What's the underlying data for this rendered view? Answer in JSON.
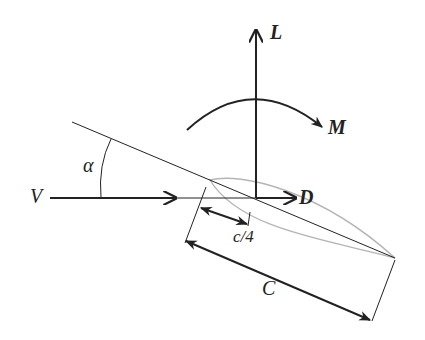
{
  "diagram": {
    "labels": {
      "lift": "L",
      "moment": "M",
      "drag": "D",
      "velocity": "V",
      "alpha": "α",
      "quarter_chord": "c/4",
      "chord": "C"
    },
    "colors": {
      "line": "#222222",
      "airfoil": "#b5b5b5",
      "background": "#ffffff"
    }
  }
}
